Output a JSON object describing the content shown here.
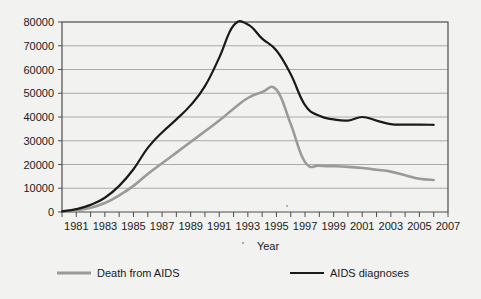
{
  "chart_data": {
    "type": "line",
    "title": "",
    "xlabel": "Year",
    "ylabel": "",
    "xlim": [
      1980,
      2007
    ],
    "ylim": [
      0,
      80000
    ],
    "grid": true,
    "legend_position": "bottom",
    "y_ticks": [
      0,
      10000,
      20000,
      30000,
      40000,
      50000,
      60000,
      70000,
      80000
    ],
    "y_tick_labels": [
      "0",
      "10000",
      "20000",
      "30000",
      "40000",
      "50000",
      "60000",
      "70000",
      "80000"
    ],
    "x_ticks": [
      1980,
      1981,
      1982,
      1983,
      1984,
      1985,
      1986,
      1987,
      1988,
      1989,
      1990,
      1991,
      1992,
      1993,
      1994,
      1995,
      1996,
      1997,
      1998,
      1999,
      2000,
      2001,
      2002,
      2003,
      2004,
      2005,
      2006,
      2007
    ],
    "x_tick_labels": [
      "1981",
      "1983",
      "1985",
      "1987",
      "1989",
      "1991",
      "1993",
      "1995",
      "1997",
      "1999",
      "2001",
      "2003",
      "2005",
      "2007"
    ],
    "x_tick_label_years": [
      1981,
      1983,
      1985,
      1987,
      1989,
      1991,
      1993,
      1995,
      1997,
      1999,
      2001,
      2003,
      2005,
      2007
    ],
    "x": [
      1980,
      1981,
      1982,
      1983,
      1984,
      1985,
      1986,
      1987,
      1988,
      1989,
      1990,
      1991,
      1992,
      1993,
      1994,
      1995,
      1996,
      1997,
      1998,
      1999,
      2000,
      2001,
      2002,
      2003,
      2004,
      2005,
      2006
    ],
    "series": [
      {
        "name": "AIDS diagnoses",
        "color": "#1a1a1a",
        "width": 2.2,
        "values": [
          300,
          1200,
          3000,
          6000,
          11000,
          18000,
          27000,
          33500,
          39000,
          45000,
          53000,
          65000,
          78500,
          79000,
          73000,
          68000,
          58000,
          45000,
          40500,
          39000,
          38500,
          40000,
          38500,
          37000,
          36800,
          36800,
          36700
        ]
      },
      {
        "name": "Death from AIDS",
        "color": "#9a9a97",
        "width": 2.6,
        "values": [
          200,
          700,
          1800,
          3800,
          7000,
          11000,
          16000,
          20500,
          25000,
          29500,
          34000,
          38500,
          43500,
          48000,
          50500,
          51500,
          37000,
          21000,
          19500,
          19300,
          19000,
          18500,
          17800,
          17000,
          15500,
          14000,
          13500
        ]
      }
    ],
    "legend": [
      {
        "label": "Death from AIDS",
        "color": "#9a9a97"
      },
      {
        "label": "AIDS diagnoses",
        "color": "#1a1a1a"
      }
    ]
  }
}
